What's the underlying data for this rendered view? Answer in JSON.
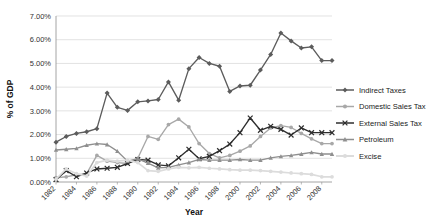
{
  "chart_data": {
    "type": "line",
    "title": "",
    "xlabel": "Year",
    "ylabel": "% of GDP",
    "grid": true,
    "legend_position": "right",
    "xlim": [
      1982,
      2009
    ],
    "ylim": [
      0,
      7
    ],
    "x": [
      1982,
      1983,
      1984,
      1985,
      1986,
      1987,
      1988,
      1989,
      1990,
      1991,
      1992,
      1993,
      1994,
      1995,
      1996,
      1997,
      1998,
      1999,
      2000,
      2001,
      2002,
      2003,
      2004,
      2005,
      2006,
      2007,
      2008,
      2009
    ],
    "xtick_labels": [
      "1982",
      "1984",
      "1986",
      "1988",
      "1990",
      "1992",
      "1994",
      "1996",
      "1998",
      "2000",
      "2002",
      "2004",
      "2006",
      "2008"
    ],
    "ytick_labels": [
      "0.00%",
      "1.00%",
      "2.00%",
      "3.00%",
      "4.00%",
      "5.00%",
      "6.00%",
      "7.00%"
    ],
    "ytick_values": [
      0,
      1,
      2,
      3,
      4,
      5,
      6,
      7
    ],
    "series": [
      {
        "name": "Indirect Taxes",
        "color": "#5c5c5c",
        "marker": "diamond",
        "values": [
          1.68,
          1.92,
          2.05,
          2.12,
          2.25,
          3.75,
          3.15,
          3.02,
          3.38,
          3.42,
          3.48,
          4.22,
          3.45,
          4.78,
          5.25,
          5.0,
          4.88,
          3.82,
          4.05,
          4.08,
          4.72,
          5.38,
          6.28,
          5.95,
          5.65,
          5.7,
          5.12,
          5.12
        ],
        "values_note": "percent of GDP"
      },
      {
        "name": "Domestic Sales Tax",
        "color": "#a8a8a8",
        "marker": "dot",
        "values": [
          0.18,
          0.22,
          0.3,
          0.35,
          1.12,
          0.88,
          0.82,
          0.78,
          1.0,
          1.92,
          1.8,
          2.42,
          2.65,
          2.32,
          1.62,
          1.2,
          1.02,
          1.12,
          1.3,
          1.52,
          1.92,
          2.28,
          2.38,
          2.3,
          2.05,
          1.82,
          1.62,
          1.62
        ]
      },
      {
        "name": "External Sales Tax",
        "color": "#2e2e2e",
        "marker": "cross",
        "values": [
          0.1,
          0.48,
          0.22,
          0.38,
          0.55,
          0.58,
          0.62,
          0.78,
          0.95,
          0.92,
          0.72,
          0.68,
          1.02,
          1.38,
          0.98,
          1.08,
          1.32,
          1.6,
          2.08,
          2.7,
          2.18,
          2.35,
          2.22,
          1.98,
          2.28,
          2.08,
          2.08,
          2.08
        ]
      },
      {
        "name": "Petroleum",
        "color": "#8f8f8f",
        "marker": "triangle",
        "values": [
          1.35,
          1.38,
          1.42,
          1.55,
          1.62,
          1.58,
          1.3,
          0.88,
          0.98,
          0.8,
          0.6,
          0.62,
          0.72,
          0.82,
          0.95,
          0.92,
          0.92,
          0.92,
          0.95,
          0.92,
          0.92,
          1.02,
          1.08,
          1.12,
          1.18,
          1.25,
          1.18,
          1.18
        ]
      },
      {
        "name": "Excise",
        "color": "#dcdcdc",
        "marker": "dot",
        "values": [
          0.12,
          0.55,
          0.35,
          0.25,
          0.82,
          0.92,
          0.88,
          0.92,
          0.82,
          0.48,
          0.45,
          0.55,
          0.62,
          0.6,
          0.62,
          0.58,
          0.55,
          0.52,
          0.5,
          0.5,
          0.48,
          0.45,
          0.42,
          0.38,
          0.35,
          0.32,
          0.22,
          0.22
        ]
      }
    ]
  },
  "legend": {
    "items": [
      {
        "label": "Indirect Taxes"
      },
      {
        "label": "Domestic Sales Tax"
      },
      {
        "label": "External Sales Tax"
      },
      {
        "label": "Petroleum"
      },
      {
        "label": "Excise"
      }
    ]
  },
  "axes": {
    "y_title": "% of GDP",
    "x_title": "Year"
  }
}
